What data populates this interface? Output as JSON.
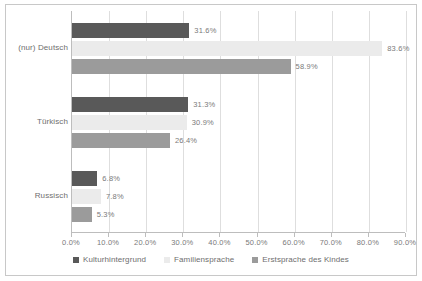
{
  "chart_data": {
    "type": "bar",
    "orientation": "horizontal",
    "title": "",
    "xlabel": "",
    "ylabel": "",
    "xlim": [
      0,
      90
    ],
    "xticks": [
      0,
      10,
      20,
      30,
      40,
      50,
      60,
      70,
      80,
      90
    ],
    "xtick_labels": [
      "0.0%",
      "10.0%",
      "20.0%",
      "30.0%",
      "40.0%",
      "50.0%",
      "60.0%",
      "70.0%",
      "80.0%",
      "90.0%"
    ],
    "grid": true,
    "legend_position": "bottom",
    "categories": [
      "(nur) Deutsch",
      "Türkisch",
      "Russisch"
    ],
    "series": [
      {
        "name": "Kulturhintergrund",
        "color": "#595959",
        "values": [
          31.6,
          31.3,
          6.8
        ],
        "labels": [
          "31.6%",
          "31.3%",
          "6.8%"
        ]
      },
      {
        "name": "Familiensprache",
        "color": "#ebebeb",
        "values": [
          83.6,
          30.9,
          7.8
        ],
        "labels": [
          "83.6%",
          "30.9%",
          "7.8%"
        ]
      },
      {
        "name": "Erstsprache des Kindes",
        "color": "#9b9b9b",
        "values": [
          58.9,
          26.4,
          5.3
        ],
        "labels": [
          "58.9%",
          "26.4%",
          "5.3%"
        ]
      }
    ]
  }
}
